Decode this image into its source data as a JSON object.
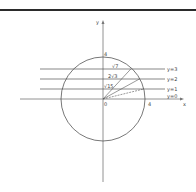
{
  "diagram": {
    "axes": {
      "x_label": "x",
      "y_label": "y",
      "origin_label": "0"
    },
    "circle": {
      "radius_label": "4",
      "top_label": "4",
      "right_label": "4"
    },
    "lines": [
      {
        "label": "y=3",
        "y": 3
      },
      {
        "label": "y=2",
        "y": 2
      },
      {
        "label": "y=1",
        "y": 1
      },
      {
        "label": "y=0",
        "y": 0
      }
    ],
    "chord_labels": [
      {
        "label": "√7",
        "y": 3
      },
      {
        "label": "2√3",
        "y": 2
      },
      {
        "label": "√15",
        "y": 1
      }
    ],
    "colors": {
      "stroke": "#555555",
      "axis": "#777777",
      "topbar": "#2b2b2b"
    }
  }
}
